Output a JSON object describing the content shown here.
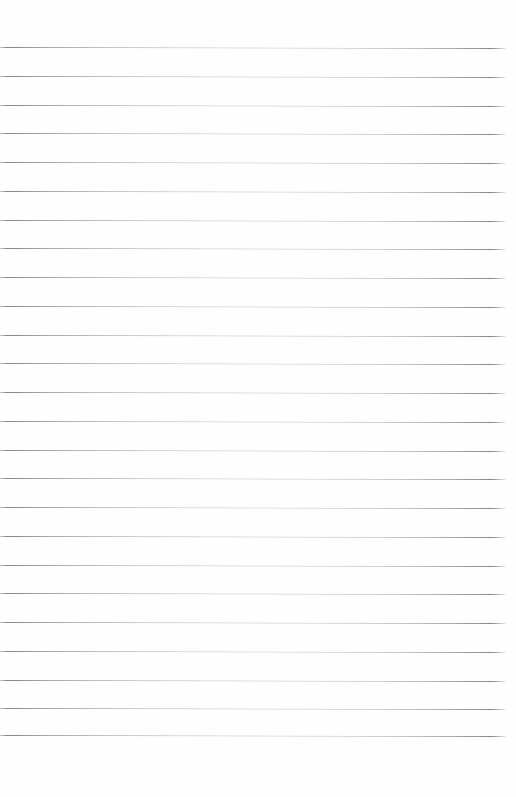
{
  "page": {
    "kind": "lined-paper",
    "width": 516,
    "height": 797,
    "background_color": "#fefefe",
    "content_text": "",
    "has_margin_rule": false,
    "has_hole_punches": false,
    "has_header_text": false
  },
  "rules": {
    "count": 25,
    "color": "#8a8a8a",
    "secondary_color": "#d8d8d8",
    "thickness_px": 1,
    "first_line_y": 47,
    "spacing_px": 28.75,
    "line_start_x": 0,
    "line_end_x": 506,
    "skew_deg": 0.12,
    "positions_y": [
      47,
      75.8,
      104.5,
      133.3,
      162,
      190.8,
      219.5,
      248.3,
      277,
      305.8,
      334.5,
      363.3,
      392,
      420.8,
      449.5,
      478.3,
      507,
      535.8,
      564.5,
      593.3,
      622,
      650.8,
      679.5,
      708.3,
      735
    ]
  },
  "margins": {
    "top_height": 47,
    "bottom_height": 62,
    "top_label": "",
    "bottom_label": ""
  },
  "write_rows": {
    "label": "",
    "placeholder": ""
  }
}
